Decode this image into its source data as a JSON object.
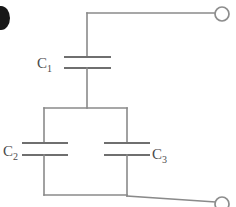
{
  "figure": {
    "background_color": "#ffffff",
    "wire_color": "#8a8a8a",
    "plate_color": "#6f6f6f",
    "label_color": "#4a4a4a",
    "width": 236,
    "height": 207
  },
  "labels": {
    "c1": {
      "base": "C",
      "sub": "1"
    },
    "c2": {
      "base": "C",
      "sub": "2"
    },
    "c3": {
      "base": "C",
      "sub": "3"
    }
  },
  "components": {
    "c1": {
      "name": "capacitor-c1",
      "plate_top_y": 57,
      "plate_bottom_y": 68,
      "plate_x1": 64,
      "plate_x2": 111,
      "lead_x": 87
    },
    "c2": {
      "name": "capacitor-c2",
      "plate_top_y": 143,
      "plate_bottom_y": 155,
      "plate_x1": 22,
      "plate_x2": 68,
      "lead_x": 44
    },
    "c3": {
      "name": "capacitor-c3",
      "plate_top_y": 143,
      "plate_bottom_y": 155,
      "plate_x1": 104,
      "plate_x2": 150,
      "lead_x": 127
    }
  },
  "terminals": {
    "top_right": {
      "name": "terminal-top-right",
      "cx": 222,
      "cy": 14,
      "r": 7
    },
    "bottom_right": {
      "name": "terminal-bottom-right",
      "cx": 222,
      "cy": 204,
      "r": 7
    }
  },
  "nodes": {
    "top_wire_y": 13,
    "top_corner_x": 87,
    "junction_y": 108,
    "bottom_rail_y": 195,
    "left_branch_x": 44,
    "right_branch_x": 127
  },
  "artifact": {
    "name": "scan-edge-blob",
    "cx": 1,
    "cy": 18,
    "rx": 9,
    "ry": 12
  }
}
